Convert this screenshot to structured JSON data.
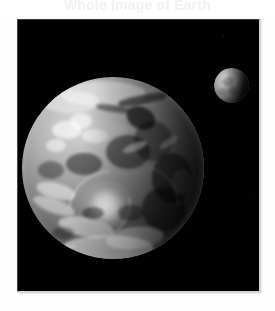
{
  "header": {
    "title": "Whole Image of Earth"
  },
  "photo": {
    "caption": "Earth and Moon seen together in space",
    "background_color": "#000000",
    "frame_border_color": "#cfcfcf",
    "subjects": [
      {
        "name": "earth",
        "label": "Earth",
        "description": "Nearly full disk of Earth, grayscale, with swirling cloud systems, a large cyclone in the lower hemisphere and a dark terminator at the right limb",
        "center_x_pct": 39,
        "center_y_pct": 54,
        "diameter_px": 182,
        "illumination": "lit from upper left"
      },
      {
        "name": "moon",
        "label": "Moon",
        "description": "Small gibbous Moon, cratered, lit from the left, positioned upper right of Earth",
        "center_x_pct": 88,
        "center_y_pct": 24,
        "diameter_px": 35,
        "illumination": "lit from left"
      }
    ],
    "star_count": 3
  }
}
